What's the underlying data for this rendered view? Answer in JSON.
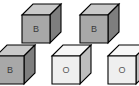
{
  "scene": {
    "title": "Cube set illustration",
    "background_color": "#ffffff",
    "width": 139,
    "height": 86,
    "description": "Five isometric cubes arranged in two rows, each labeled with a letter"
  },
  "palette": {
    "outline": "#000000",
    "gray_front": "#a8a8a8",
    "gray_top": "#c9c9c9",
    "gray_side": "#7e7e7e",
    "white_front": "#efefef",
    "white_top": "#f7f7f7",
    "white_side": "#bdbdbd",
    "label_dark": "#3a3a3a",
    "label_light": "#5a5a5a"
  },
  "cubes": [
    {
      "id": "cube-top-left",
      "label": "B",
      "shade": "gray",
      "x": 20,
      "y": 2,
      "row": "top"
    },
    {
      "id": "cube-top-right",
      "label": "B",
      "shade": "gray",
      "x": 78,
      "y": 2,
      "row": "top"
    },
    {
      "id": "cube-bottom-left",
      "label": "B",
      "shade": "gray",
      "x": -6,
      "y": 43,
      "row": "bottom"
    },
    {
      "id": "cube-bottom-middle",
      "label": "O",
      "shade": "white",
      "x": 50,
      "y": 43,
      "row": "bottom"
    },
    {
      "id": "cube-bottom-right",
      "label": "O",
      "shade": "white",
      "x": 106,
      "y": 43,
      "row": "bottom"
    }
  ],
  "counts": {
    "total": 5,
    "labeled_b": 3,
    "labeled_o": 2
  }
}
